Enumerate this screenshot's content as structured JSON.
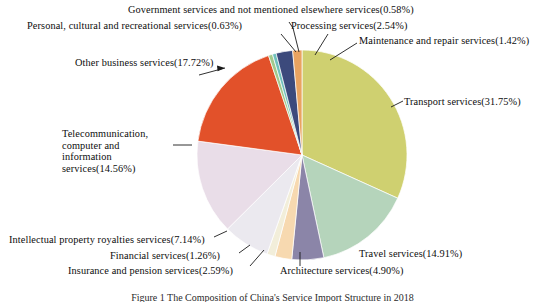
{
  "figure": {
    "caption": "Figure 1 The Composition of China's Service Import Structure in 2018",
    "background_color": "#ffffff",
    "text_color": "#0d0d0d"
  },
  "chart_data": {
    "type": "pie",
    "title": "",
    "xlabel": "",
    "ylabel": "",
    "units": "percent",
    "start_angle_deg": 0,
    "direction": "clockwise",
    "center": {
      "x": 302,
      "y": 155
    },
    "radius": 105,
    "legend_position": "none",
    "grid": false,
    "total": 100.0,
    "categories": [
      "Transport services",
      "Travel services",
      "Architecture services",
      "Insurance and pension services",
      "Financial services",
      "Intellectual property royalties services",
      "Telecommunication, computer and information services",
      "Other business services",
      "Personal, cultural and recreational services",
      "Government services and not mentioned elsewhere services",
      "Processing services",
      "Maintenance and repair services"
    ],
    "values": [
      31.75,
      14.91,
      4.9,
      2.59,
      1.26,
      7.14,
      14.56,
      17.72,
      0.63,
      0.58,
      2.54,
      1.42
    ],
    "colors": [
      "#cfd070",
      "#b5d4bb",
      "#8b85a8",
      "#f7d9b0",
      "#f2eeda",
      "#ebe9ef",
      "#e9dde8",
      "#e2512a",
      "#a2c98c",
      "#6fc0bc",
      "#3c4a7c",
      "#e9a360"
    ],
    "slices": [
      {
        "name": "Transport services",
        "value": 31.75,
        "color": "#cfd070",
        "label": "Transport services(31.75%)"
      },
      {
        "name": "Travel services",
        "value": 14.91,
        "color": "#b5d4bb",
        "label": "Travel services(14.91%)"
      },
      {
        "name": "Architecture services",
        "value": 4.9,
        "color": "#8b85a8",
        "label": "Architecture services(4.90%)"
      },
      {
        "name": "Insurance and pension services",
        "value": 2.59,
        "color": "#f7d9b0",
        "label": "Insurance and pension services(2.59%)"
      },
      {
        "name": "Financial services",
        "value": 1.26,
        "color": "#f2eeda",
        "label": "Financial services(1.26%)"
      },
      {
        "name": "Intellectual property royalties services",
        "value": 7.14,
        "color": "#ebe9ef",
        "label": "Intellectual property royalties services(7.14%)"
      },
      {
        "name": "Telecommunication, computer and information services",
        "value": 14.56,
        "color": "#e9dde8",
        "label": "Telecommunication, computer and information services(14.56%)"
      },
      {
        "name": "Other business services",
        "value": 17.72,
        "color": "#e2512a",
        "label": "Other business services(17.72%)"
      },
      {
        "name": "Personal, cultural and recreational services",
        "value": 0.63,
        "color": "#a2c98c",
        "label": "Personal, cultural and recreational services(0.63%)"
      },
      {
        "name": "Government services and not mentioned elsewhere services",
        "value": 0.58,
        "color": "#6fc0bc",
        "label": "Government services and not mentioned elsewhere services(0.58%)"
      },
      {
        "name": "Processing services",
        "value": 2.54,
        "color": "#3c4a7c",
        "label": "Processing services(2.54%)"
      },
      {
        "name": "Maintenance and repair services",
        "value": 1.42,
        "color": "#e9a360",
        "label": "Maintenance and repair services(1.42%)"
      }
    ]
  },
  "labels": {
    "government": "Government services and not mentioned elsewhere services(0.58%)",
    "personal": "Personal, cultural and recreational services(0.63%)",
    "processing": "Processing services(2.54%)",
    "maintenance": "Maintenance and repair services(1.42%)",
    "other_business": "Other business services(17.72%)",
    "transport": "Transport services(31.75%)",
    "telecom_line1": "Telecommunication,",
    "telecom_line2": "computer and information",
    "telecom_line3": "services(14.56%)",
    "intellectual": "Intellectual property royalties services(7.14%)",
    "financial": "Financial services(1.26%)",
    "insurance": "Insurance and pension services(2.59%)",
    "architecture": "Architecture services(4.90%)",
    "travel": "Travel services(14.91%)"
  }
}
